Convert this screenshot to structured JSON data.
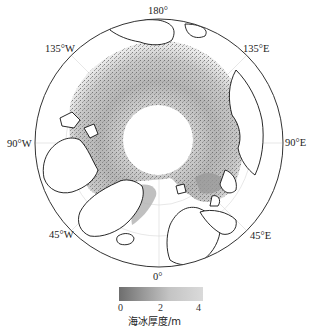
{
  "map": {
    "projection": "north-polar-stereographic",
    "region": "Arctic",
    "longitude_labels": {
      "top": "180°",
      "top_left": "135°W",
      "top_right": "135°E",
      "left": "90°W",
      "right": "90°E",
      "bottom_left": "45°W",
      "bottom_right": "45°E",
      "bottom": "0°"
    },
    "pole_hole": "no data (white)"
  },
  "colorbar": {
    "label": "海冰厚度/m",
    "ticks": [
      "0",
      "2",
      "4"
    ],
    "min": 0,
    "max": 4,
    "color_low": "#6e6e6e",
    "color_high": "#dadada"
  },
  "colors": {
    "background": "#ffffff",
    "coastline": "#111111",
    "graticule": "#d0d0d0",
    "ice_dark": "#6e6e6e",
    "ice_light": "#d8d8d8"
  }
}
